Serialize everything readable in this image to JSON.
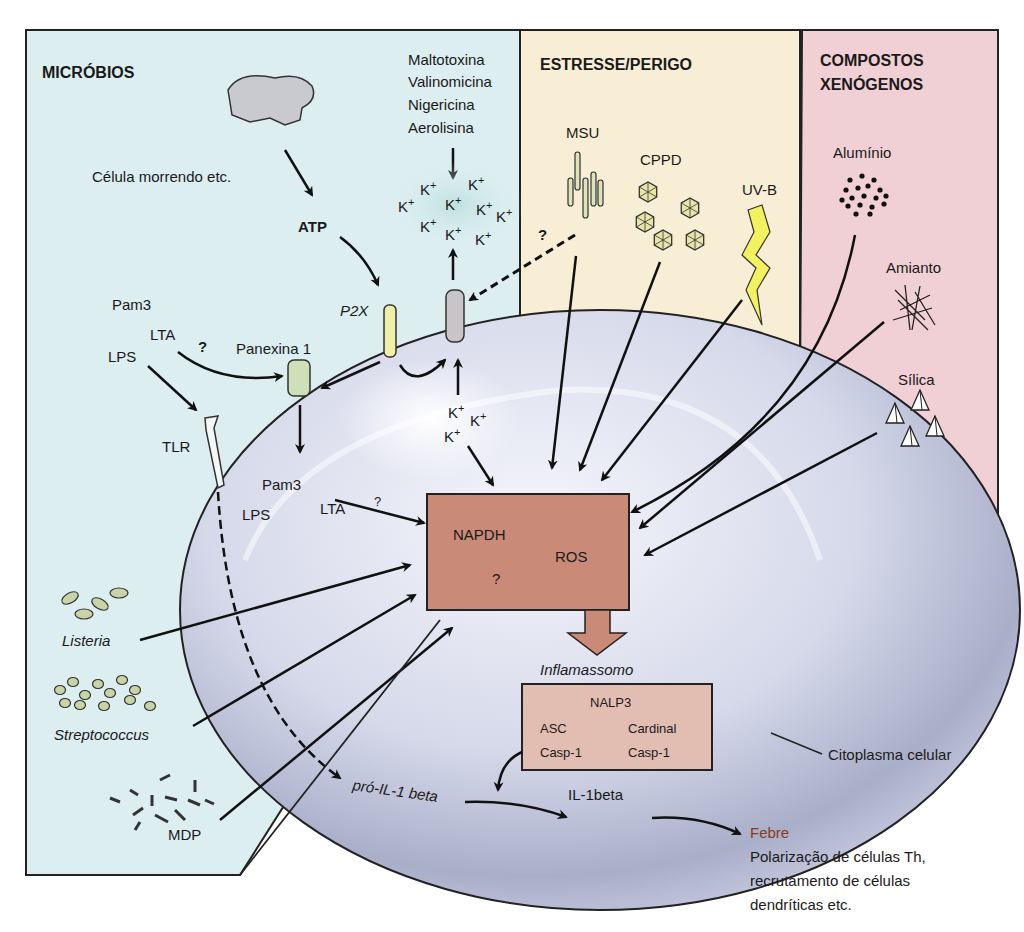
{
  "panels": {
    "microbes": {
      "title": "MICRÓBIOS",
      "color": "#dceef0"
    },
    "stress": {
      "title": "ESTRESSE/PERIGO",
      "color": "#f8eed6"
    },
    "xeno": {
      "title_line1": "COMPOSTOS",
      "title_line2": "XENÓGENOS",
      "color": "#f0d0d4"
    }
  },
  "microbes": {
    "dying_cell": "Célula morrendo etc.",
    "atp": "ATP",
    "toxins": [
      "Maltotoxina",
      "Valinomicina",
      "Nigericina",
      "Aerolisina"
    ],
    "k_ion": "K+",
    "p2x": "P2X",
    "pannexin": "Panexina 1",
    "pam3": "Pam3",
    "lta": "LTA",
    "lps": "LPS",
    "tlr": "TLR",
    "question": "?",
    "listeria": "Listeria",
    "streptococcus": "Streptococcus",
    "mdp": "MDP"
  },
  "stress": {
    "msu": "MSU",
    "cppd": "CPPD",
    "uvb": "UV-B"
  },
  "xeno": {
    "aluminium": "Alumínio",
    "asbestos": "Amianto",
    "silica": "Sílica"
  },
  "center": {
    "napdh": "NAPDH",
    "ros": "ROS",
    "question": "?",
    "box_color": "#c98a78"
  },
  "inflammasome": {
    "title": "Inflamassomo",
    "nalp3": "NALP3",
    "asc": "ASC",
    "cardinal": "Cardinal",
    "casp1_left": "Casp-1",
    "casp1_right": "Casp-1",
    "box_color": "#e2beb2"
  },
  "outputs": {
    "pro_il1": "pró-IL-1 beta",
    "il1beta": "IL-1beta",
    "cytoplasm": "Citoplasma celular",
    "fever": "Febre",
    "fever_color": "#8a3a1a",
    "effects": [
      "Polarização de células Th,",
      "recrutamento de células",
      "dendríticas etc."
    ]
  }
}
